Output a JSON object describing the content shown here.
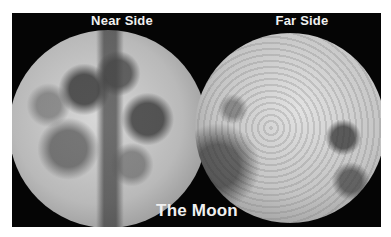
{
  "image": {
    "title": "The Moon",
    "panels": [
      {
        "label": "Near Side"
      },
      {
        "label": "Far Side"
      }
    ],
    "colors": {
      "background": "#050505",
      "text": "#f0f0f0",
      "frame": "#ffffff"
    }
  }
}
